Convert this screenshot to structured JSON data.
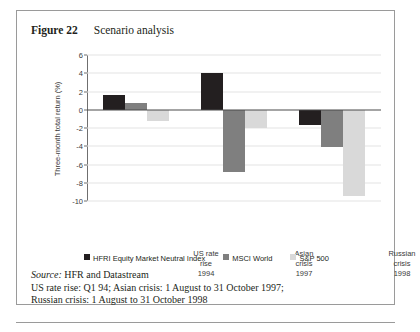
{
  "figure": {
    "label": "Figure 22",
    "title": "Scenario analysis"
  },
  "notes": {
    "source_label": "Source:",
    "source_text": " HFR and Datastream",
    "line2": "US rate rise: Q1 94; Asian crisis: 1 August to 31 October 1997;",
    "line3": "Russian crisis: 1 August to 31 October 1998"
  },
  "colors": {
    "series_hfri": "#231f20",
    "series_msci": "#7f7f7f",
    "series_sp500": "#d9d9d9",
    "gridline": "#e3e3e3",
    "axis": "#6f6f6f",
    "box_border": "#9a9a9a"
  },
  "chart_data": {
    "type": "bar",
    "title": "Scenario analysis",
    "xlabel": "",
    "ylabel": "Three-month total return (%)",
    "ylim": [
      -10,
      6
    ],
    "ytick_step": 2,
    "yticks": [
      6,
      4,
      2,
      0,
      -2,
      -4,
      -6,
      -8,
      -10
    ],
    "ytick_labels": [
      "6",
      "4",
      "2",
      "0",
      "-2",
      "-4",
      "-6",
      "-8",
      "-10"
    ],
    "grid": true,
    "legend_position": "bottom",
    "categories": [
      "US rate rise 1994",
      "Asian crisis 1997",
      "Russian crisis 1998"
    ],
    "category_lines": [
      [
        "US rate",
        "rise",
        "1994"
      ],
      [
        "Asian",
        "crisis",
        "1997"
      ],
      [
        "Russian",
        "crisis",
        "1998"
      ]
    ],
    "series": [
      {
        "name": "HFRI Equity Market Neutral Index",
        "color": "#231f20",
        "values": [
          1.6,
          4.0,
          -1.7
        ]
      },
      {
        "name": "MSCI World",
        "color": "#7f7f7f",
        "values": [
          0.7,
          -6.8,
          -4.1
        ]
      },
      {
        "name": "S&P 500",
        "color": "#d9d9d9",
        "values": [
          -1.2,
          -2.0,
          -9.4
        ]
      }
    ]
  }
}
